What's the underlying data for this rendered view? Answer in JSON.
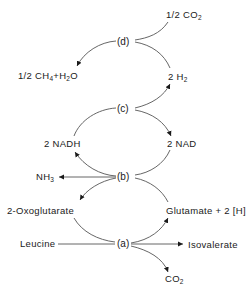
{
  "diagram": {
    "type": "metabolic-pathway",
    "nodes": {
      "a": "(a)",
      "b": "(b)",
      "c": "(c)",
      "d": "(d)"
    },
    "labels": {
      "co2_half": {
        "main": "1/2 CO",
        "sub": "2"
      },
      "ch4_h2o": {
        "p1": "1/2 CH",
        "s1": "4",
        "p2": "+H",
        "s2": "2",
        "p3": "O"
      },
      "h2": {
        "main": "2 H",
        "sub": "2"
      },
      "nadh": "2 NADH",
      "nad": "2 NAD",
      "nh3": {
        "main": "NH",
        "sub": "3"
      },
      "oxoglutarate": "2-Oxoglutarate",
      "glutamate": "Glutamate + 2 [H]",
      "leucine": "Leucine",
      "isovalerate": "Isovalerate",
      "co2": {
        "main": "CO",
        "sub": "2"
      }
    },
    "edges": [
      {
        "from": "1/2 CO2",
        "to": "(d)"
      },
      {
        "from": "2 H2",
        "to": "(d)"
      },
      {
        "from": "(d)",
        "to": "1/2 CH4+H2O"
      },
      {
        "from": "(c)",
        "to": "2 H2"
      },
      {
        "from": "2 NADH",
        "to": "(c)"
      },
      {
        "from": "(c)",
        "to": "2 NAD"
      },
      {
        "from": "2 NAD",
        "to": "(b)"
      },
      {
        "from": "(b)",
        "to": "2 NADH"
      },
      {
        "from": "(b)",
        "to": "NH3"
      },
      {
        "from": "Glutamate + 2 [H]",
        "to": "(b)"
      },
      {
        "from": "(b)",
        "to": "2-Oxoglutarate"
      },
      {
        "from": "2-Oxoglutarate",
        "to": "(a)"
      },
      {
        "from": "(a)",
        "to": "Glutamate + 2 [H]"
      },
      {
        "from": "Leucine",
        "to": "(a)"
      },
      {
        "from": "(a)",
        "to": "Isovalerate"
      },
      {
        "from": "(a)",
        "to": "CO2"
      }
    ]
  }
}
